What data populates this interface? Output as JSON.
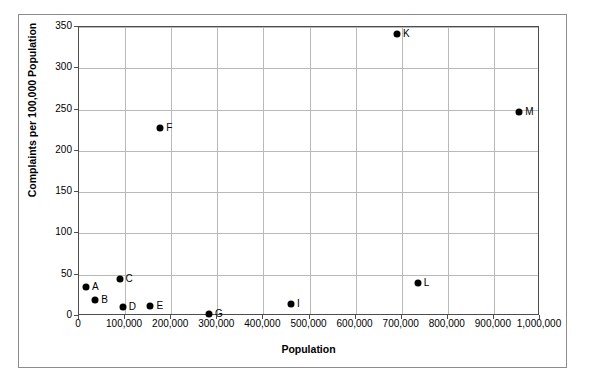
{
  "chart_data": {
    "type": "scatter",
    "title": "",
    "xlabel": "Population",
    "ylabel": "Complaints per 100,000 Population",
    "xlim": [
      0,
      1000000
    ],
    "ylim": [
      0,
      350
    ],
    "grid": true,
    "legend": false,
    "xticks": [
      0,
      100000,
      200000,
      300000,
      400000,
      500000,
      600000,
      700000,
      800000,
      900000,
      1000000
    ],
    "xtick_labels": [
      "0",
      "100,000",
      "200,000",
      "300,000",
      "400,000",
      "500,000",
      "600,000",
      "700,000",
      "800,000",
      "900,000",
      "1,000,000"
    ],
    "yticks": [
      0,
      50,
      100,
      150,
      200,
      250,
      300,
      350
    ],
    "ytick_labels": [
      "0",
      "50",
      "100",
      "150",
      "200",
      "250",
      "300",
      "350"
    ],
    "marker_color": "#000000",
    "points": [
      {
        "label": "A",
        "x": 15000,
        "y": 35
      },
      {
        "label": "B",
        "x": 35000,
        "y": 19
      },
      {
        "label": "C",
        "x": 88000,
        "y": 45
      },
      {
        "label": "D",
        "x": 95000,
        "y": 11
      },
      {
        "label": "E",
        "x": 155000,
        "y": 12
      },
      {
        "label": "F",
        "x": 176000,
        "y": 228
      },
      {
        "label": "G",
        "x": 282000,
        "y": 2
      },
      {
        "label": "I",
        "x": 460000,
        "y": 14
      },
      {
        "label": "K",
        "x": 690000,
        "y": 341
      },
      {
        "label": "L",
        "x": 735000,
        "y": 40
      },
      {
        "label": "M",
        "x": 955000,
        "y": 247
      }
    ]
  }
}
